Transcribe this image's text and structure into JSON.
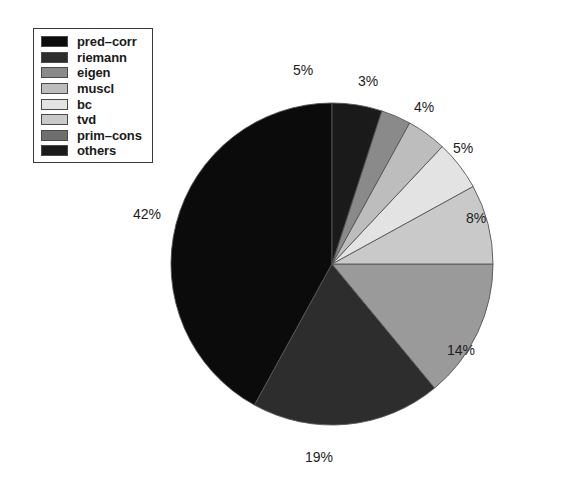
{
  "chart_data": {
    "type": "pie",
    "title": "",
    "labels": [
      "pred-corr",
      "riemann",
      "prim-cons",
      "tvd",
      "bc",
      "muscl",
      "eigen",
      "others"
    ],
    "values": [
      42,
      19,
      14,
      8,
      5,
      4,
      3,
      5
    ],
    "value_labels": [
      "42%",
      "19%",
      "14%",
      "8%",
      "5%",
      "4%",
      "3%",
      "5%"
    ],
    "units": "percent",
    "total": 100,
    "legend_position": "top-left",
    "start_angle_deg": 90,
    "direction": "counter-clockwise",
    "grid": false,
    "xlabel": "",
    "ylabel": "",
    "colors": [
      "#0b0b0b",
      "#2d2d2d",
      "#9a9a9a",
      "#c9c9c9",
      "#e3e3e3",
      "#bdbdbd",
      "#8a8a8a",
      "#1a1a1a"
    ]
  },
  "legend": {
    "items": [
      {
        "label": "pred–corr",
        "color": "#0b0b0b"
      },
      {
        "label": "riemann",
        "color": "#2d2d2d"
      },
      {
        "label": "eigen",
        "color": "#8a8a8a"
      },
      {
        "label": "muscl",
        "color": "#bdbdbd"
      },
      {
        "label": "bc",
        "color": "#e3e3e3"
      },
      {
        "label": "tvd",
        "color": "#c9c9c9"
      },
      {
        "label": "prim–cons",
        "color": "#6e6e6e"
      },
      {
        "label": "others",
        "color": "#1a1a1a"
      }
    ]
  },
  "pie_labels": {
    "pred_corr": "42%",
    "riemann": "19%",
    "prim_cons": "14%",
    "tvd": "8%",
    "bc": "5%",
    "muscl": "4%",
    "eigen": "3%",
    "others": "5%"
  }
}
